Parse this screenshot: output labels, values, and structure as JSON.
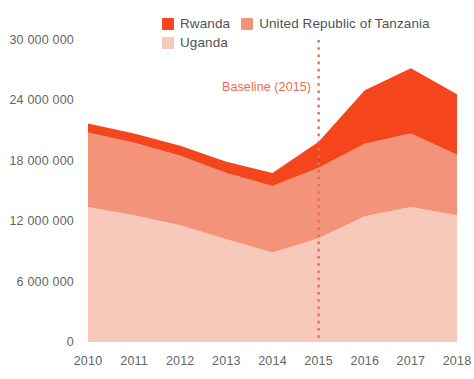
{
  "legend": {
    "items": [
      {
        "label": "Rwanda",
        "color": "#F4451C",
        "swatch_name": "legend-swatch-rwanda"
      },
      {
        "label": "United Republic of Tanzania",
        "color": "#F3937A",
        "swatch_name": "legend-swatch-tanzania"
      },
      {
        "label": "Uganda",
        "color": "#F7C9BA",
        "swatch_name": "legend-swatch-uganda"
      }
    ]
  },
  "annotation": {
    "baseline_label": "Baseline (2015)",
    "baseline_year": "2015",
    "baseline_color": "#EF6A53"
  },
  "axes": {
    "y_ticks": [
      "0",
      "6 000 000",
      "12 000 000",
      "18 000 000",
      "24 000 000",
      "30 000 000"
    ],
    "x_ticks": [
      "2010",
      "2011",
      "2012",
      "2013",
      "2014",
      "2015",
      "2016",
      "2017",
      "2018"
    ]
  },
  "chart_data": {
    "type": "area",
    "title": "",
    "subtitle": "",
    "xlabel": "",
    "ylabel": "",
    "stacked": true,
    "grid": false,
    "legend_position": "top",
    "x": [
      2010,
      2011,
      2012,
      2013,
      2014,
      2015,
      2016,
      2017,
      2018
    ],
    "categories": [
      "2010",
      "2011",
      "2012",
      "2013",
      "2014",
      "2015",
      "2016",
      "2017",
      "2018"
    ],
    "ylim": [
      0,
      30000000
    ],
    "y_ticks": [
      0,
      6000000,
      12000000,
      18000000,
      24000000,
      30000000
    ],
    "series": [
      {
        "name": "Uganda",
        "color": "#F7C9BA",
        "values": [
          13400000,
          12600000,
          11600000,
          10200000,
          8900000,
          10300000,
          12500000,
          13400000,
          12600000
        ]
      },
      {
        "name": "United Republic of Tanzania",
        "color": "#F3937A",
        "values": [
          7400000,
          7200000,
          6900000,
          6600000,
          6600000,
          7000000,
          7200000,
          7300000,
          6000000
        ]
      },
      {
        "name": "Rwanda",
        "color": "#F4451C",
        "values": [
          900000,
          900000,
          1000000,
          1100000,
          1300000,
          2600000,
          5300000,
          6500000,
          6000000
        ]
      }
    ],
    "totals": [
      21700000,
      20700000,
      19500000,
      17900000,
      16800000,
      19900000,
      25000000,
      27200000,
      24600000
    ],
    "annotations": [
      {
        "text": "Baseline (2015)",
        "x": 2015,
        "type": "vertical-dashed-line",
        "color": "#EF6A53"
      }
    ]
  }
}
